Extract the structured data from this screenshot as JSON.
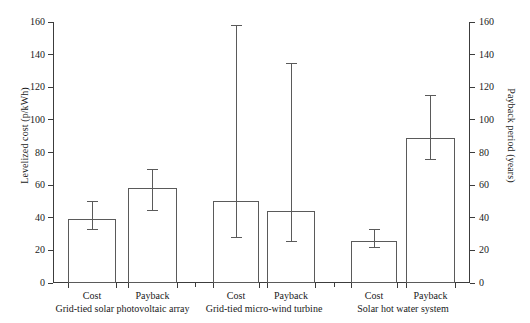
{
  "chart_data": {
    "type": "bar",
    "title": "",
    "xlabel": "",
    "ylabel": "Levelized cost (p/kWh)",
    "ylabel_right": "Payback period (years)",
    "ylim": [
      0,
      160
    ],
    "ylim_right": [
      0,
      160
    ],
    "yticks": [
      0,
      20,
      40,
      60,
      80,
      100,
      120,
      140,
      160
    ],
    "yticks_right": [
      0,
      20,
      40,
      60,
      80,
      100,
      120,
      140,
      160
    ],
    "grid": false,
    "legend": "none",
    "categories": [
      "Cost",
      "Payback",
      "Cost",
      "Payback",
      "Cost",
      "Payback"
    ],
    "groups": [
      "Grid-tied solar photovoltaic array",
      "Grid-tied micro-wind turbine",
      "Solar hot water system"
    ],
    "bars": [
      {
        "group": "Grid-tied solar photovoltaic array",
        "category": "Cost",
        "axis": "left",
        "value": 39,
        "err_low": 33,
        "err_high": 50
      },
      {
        "group": "Grid-tied solar photovoltaic array",
        "category": "Payback",
        "axis": "right",
        "value": 58,
        "err_low": 45,
        "err_high": 70
      },
      {
        "group": "Grid-tied micro-wind turbine",
        "category": "Cost",
        "axis": "left",
        "value": 50,
        "err_low": 28,
        "err_high": 158
      },
      {
        "group": "Grid-tied micro-wind turbine",
        "category": "Payback",
        "axis": "right",
        "value": 44,
        "err_low": 26,
        "err_high": 135
      },
      {
        "group": "Solar hot water system",
        "category": "Cost",
        "axis": "left",
        "value": 26,
        "err_low": 22,
        "err_high": 33
      },
      {
        "group": "Solar hot water system",
        "category": "Payback",
        "axis": "right",
        "value": 89,
        "err_low": 76,
        "err_high": 115
      }
    ],
    "bar_color": "#ffffff",
    "bar_edge_color": "#5a5a5a",
    "axis_color": "#3c3c3c"
  }
}
